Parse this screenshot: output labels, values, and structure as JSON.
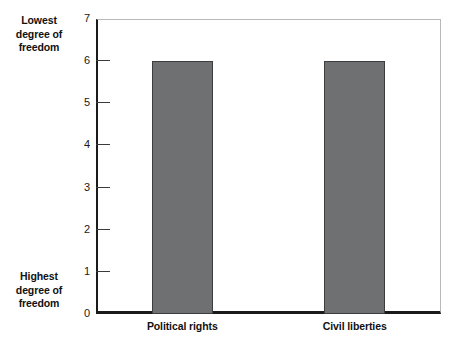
{
  "chart_data": {
    "type": "bar",
    "title": "",
    "xlabel": "",
    "ylabel": "",
    "categories": [
      "Political rights",
      "Civil liberties"
    ],
    "values": [
      6,
      6
    ],
    "ylim": [
      0,
      7
    ],
    "yticks": [
      "0",
      "1",
      "2",
      "3",
      "4",
      "5",
      "6",
      "7"
    ],
    "grid": false,
    "legend": null,
    "bar_color": "#6e7072",
    "bar_edge_color": "#3b3d3e",
    "annotations": [
      {
        "id": "lowest",
        "position": "top-left-outside",
        "lines": [
          "Lowest",
          "degree of",
          "freedom"
        ]
      },
      {
        "id": "highest",
        "position": "bottom-left-outside",
        "lines": [
          "Highest",
          "degree of",
          "freedom"
        ]
      }
    ]
  }
}
